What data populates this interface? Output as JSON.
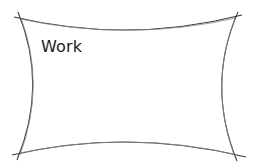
{
  "shape": {
    "type": "concave-rectangle-sketch",
    "stroke_color": "#3a3a3a",
    "fill_color": "#ffffff",
    "label": "Work"
  }
}
